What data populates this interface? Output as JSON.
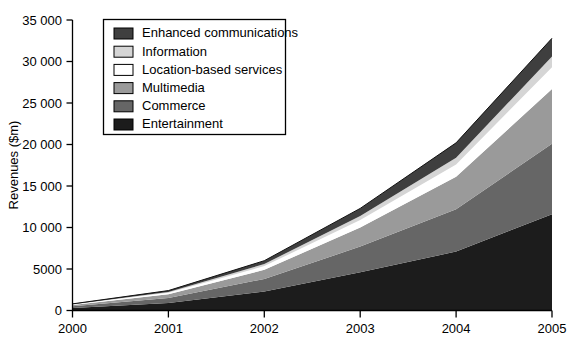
{
  "chart_data": {
    "type": "area",
    "stacked": true,
    "title": "",
    "subtitle": "",
    "xlabel": "",
    "ylabel": "Revenues ($m)",
    "x": [
      2000,
      2001,
      2002,
      2003,
      2004,
      2005
    ],
    "categories": [
      "2000",
      "2001",
      "2002",
      "2003",
      "2004",
      "2005"
    ],
    "xtick_labels": [
      "2000",
      "2001",
      "2002",
      "2003",
      "2004",
      "2005"
    ],
    "ytick_labels": [
      "0",
      "5000",
      "10 000",
      "15 000",
      "20 000",
      "25 000",
      "30 000",
      "35 000"
    ],
    "ytick_values": [
      0,
      5000,
      10000,
      15000,
      20000,
      25000,
      30000,
      35000
    ],
    "ylim": [
      0,
      35000
    ],
    "xlim": [
      2000,
      2005
    ],
    "grid": false,
    "legend_position": "top-left-inset",
    "series": [
      {
        "name": "Entertainment",
        "color": "#1c1c1c",
        "values": [
          300,
          900,
          2300,
          4600,
          7100,
          11600
        ]
      },
      {
        "name": "Commerce",
        "color": "#666666",
        "values": [
          200,
          600,
          1500,
          3100,
          5100,
          8500
        ]
      },
      {
        "name": "Multimedia",
        "color": "#9a9a9a",
        "values": [
          150,
          450,
          1100,
          2300,
          3900,
          6600
        ]
      },
      {
        "name": "Location-based services",
        "color": "#ffffff",
        "values": [
          70,
          180,
          450,
          900,
          1500,
          2600
        ]
      },
      {
        "name": "Information",
        "color": "#d5d5d5",
        "values": [
          40,
          100,
          250,
          500,
          800,
          1300
        ]
      },
      {
        "name": "Enhanced communications",
        "color": "#3f3f3f",
        "values": [
          40,
          170,
          400,
          900,
          1800,
          2200
        ]
      }
    ],
    "totals": [
      800,
      2400,
      6000,
      12300,
      20200,
      32800
    ]
  },
  "legend": {
    "entries": [
      {
        "label": "Enhanced communications",
        "color": "#3f3f3f"
      },
      {
        "label": "Information",
        "color": "#d5d5d5"
      },
      {
        "label": "Location-based services",
        "color": "#ffffff"
      },
      {
        "label": "Multimedia",
        "color": "#9a9a9a"
      },
      {
        "label": "Commerce",
        "color": "#666666"
      },
      {
        "label": "Entertainment",
        "color": "#1c1c1c"
      }
    ]
  },
  "axes": {
    "y_title": "Revenues ($m)",
    "y_ticks": [
      "35 000",
      "30 000",
      "25 000",
      "20 000",
      "15 000",
      "10 000",
      "5000",
      "0"
    ],
    "x_ticks": [
      "2000",
      "2001",
      "2002",
      "2003",
      "2004",
      "2005"
    ]
  }
}
